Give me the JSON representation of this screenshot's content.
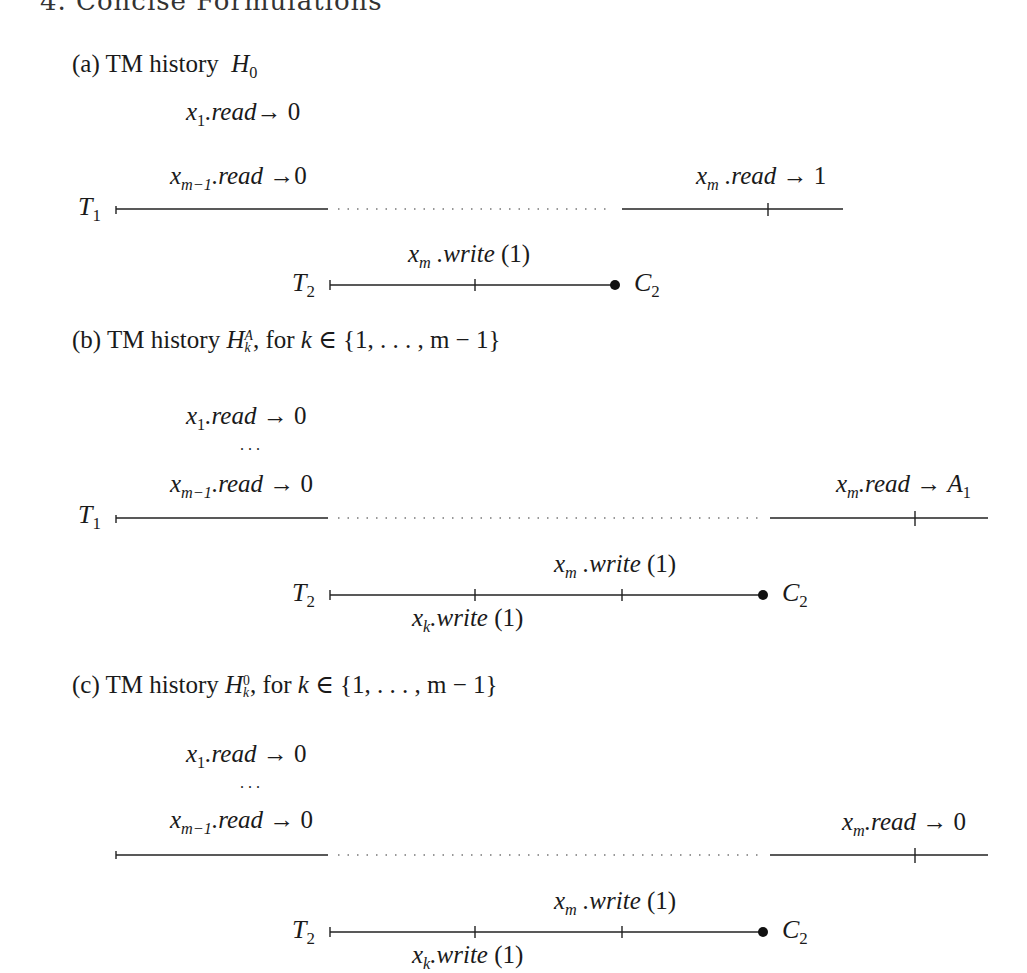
{
  "page": {
    "heading_partial": "4. Concise Formulations"
  },
  "figures": [
    {
      "id": "a",
      "caption": {
        "prefix": "(a) TM history",
        "symbol": "H",
        "subscript": "0",
        "superscript": "",
        "suffix": ""
      },
      "t1": {
        "label": "T",
        "label_sub": "1",
        "ops": [
          {
            "var": "x",
            "var_sub": "1",
            "method": ".read",
            "arrow": "→",
            "result": "0"
          },
          {
            "var": "x",
            "var_sub": "m−1",
            "method": ".read",
            "arrow": "→",
            "result": "0"
          },
          {
            "var": "x",
            "var_sub": "m",
            "method": ".read",
            "arrow": "→",
            "result": "1"
          }
        ]
      },
      "t2": {
        "label": "T",
        "label_sub": "2",
        "ops": [
          {
            "var": "x",
            "var_sub": "m",
            "method": ".write",
            "arg": "(1)"
          }
        ],
        "commit": {
          "label": "C",
          "label_sub": "2"
        }
      }
    },
    {
      "id": "b",
      "caption": {
        "prefix": "(b) TM history",
        "symbol": "H",
        "subscript": "k",
        "superscript": "A",
        "suffix": ", for",
        "set_var": "k",
        "set_expr": "∈ {1, . . . , m − 1}"
      },
      "t1": {
        "label": "T",
        "label_sub": "1",
        "ellipsis": ". . .",
        "ops": [
          {
            "var": "x",
            "var_sub": "1",
            "method": ".read",
            "arrow": "→",
            "result": "0"
          },
          {
            "var": "x",
            "var_sub": "m−1",
            "method": ".read",
            "arrow": "→",
            "result": "0"
          },
          {
            "var": "x",
            "var_sub": "m",
            "method": ".read",
            "arrow": "→",
            "result": "A",
            "result_sub": "1"
          }
        ]
      },
      "t2": {
        "label": "T",
        "label_sub": "2",
        "ops": [
          {
            "var": "x",
            "var_sub": "k",
            "method": ".write",
            "arg": "(1)"
          },
          {
            "var": "x",
            "var_sub": "m",
            "method": ".write",
            "arg": "(1)"
          }
        ],
        "commit": {
          "label": "C",
          "label_sub": "2"
        }
      }
    },
    {
      "id": "c",
      "caption": {
        "prefix": "(c) TM history",
        "symbol": "H",
        "subscript": "k",
        "superscript": "0",
        "suffix": ", for",
        "set_var": "k",
        "set_expr": "∈ {1, . . . , m − 1}"
      },
      "t1": {
        "label": "",
        "label_sub": "",
        "ellipsis": ". . .",
        "ops": [
          {
            "var": "x",
            "var_sub": "1",
            "method": ".read",
            "arrow": "→",
            "result": "0"
          },
          {
            "var": "x",
            "var_sub": "m−1",
            "method": ".read",
            "arrow": "→",
            "result": "0"
          },
          {
            "var": "x",
            "var_sub": "m",
            "method": ".read",
            "arrow": "→",
            "result": "0"
          }
        ]
      },
      "t2": {
        "label": "T",
        "label_sub": "2",
        "ops": [
          {
            "var": "x",
            "var_sub": "k",
            "method": ".write",
            "arg": "(1)"
          },
          {
            "var": "x",
            "var_sub": "m",
            "method": ".write",
            "arg": "(1)"
          }
        ],
        "commit": {
          "label": "C",
          "label_sub": "2"
        }
      }
    }
  ]
}
